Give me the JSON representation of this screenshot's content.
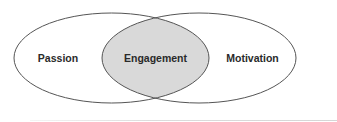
{
  "diagram": {
    "type": "venn",
    "sets": [
      {
        "label": "Passion",
        "cx": 111.5,
        "cy": 58,
        "rx": 97.5,
        "ry": 45
      },
      {
        "label": "Motivation",
        "cx": 199,
        "cy": 58,
        "rx": 97,
        "ry": 45
      }
    ],
    "intersection": {
      "label": "Engagement"
    },
    "colors": {
      "outline": "#555555",
      "intersection_fill": "#d9d9d9",
      "background": "#ffffff",
      "text": "#2a2a2a"
    }
  }
}
